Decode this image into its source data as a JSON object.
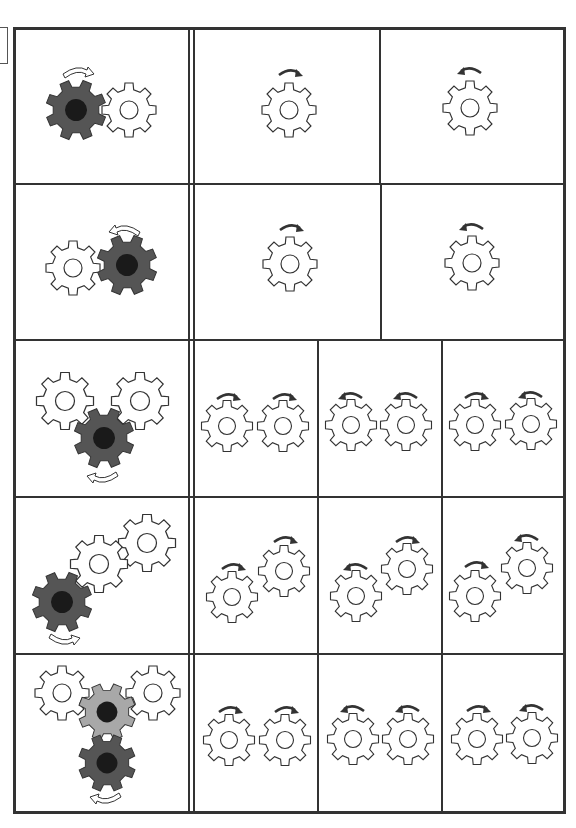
{
  "worksheet": {
    "type": "gear-rotation-direction-exercise",
    "colors": {
      "line": "#333333",
      "driver_gear": "#555555",
      "driver_hub": "#1a1a1a",
      "middle_gear": "#a8a8a8",
      "outline_gear": "#ffffff",
      "arrow": "#333333"
    },
    "rows": [
      {
        "name": "row-1",
        "example": {
          "gears": [
            {
              "role": "driver",
              "fill": "dark",
              "direction": "clockwise"
            },
            {
              "role": "driven",
              "fill": "white"
            }
          ],
          "layout": "horizontal-pair"
        },
        "options": [
          {
            "label": "option-a",
            "gears": [
              {
                "direction": "clockwise"
              }
            ]
          },
          {
            "label": "option-b",
            "gears": [
              {
                "direction": "counterclockwise"
              }
            ]
          }
        ]
      },
      {
        "name": "row-2",
        "example": {
          "gears": [
            {
              "role": "driven",
              "fill": "white"
            },
            {
              "role": "driver",
              "fill": "dark",
              "direction": "counterclockwise"
            }
          ],
          "layout": "horizontal-pair"
        },
        "options": [
          {
            "label": "option-a",
            "gears": [
              {
                "direction": "clockwise"
              }
            ]
          },
          {
            "label": "option-b",
            "gears": [
              {
                "direction": "counterclockwise"
              }
            ]
          }
        ]
      },
      {
        "name": "row-3",
        "example": {
          "gears": [
            {
              "role": "driven-left",
              "fill": "white"
            },
            {
              "role": "driven-right",
              "fill": "white"
            },
            {
              "role": "driver",
              "fill": "dark",
              "direction": "counterclockwise"
            }
          ],
          "layout": "triangle"
        },
        "options": [
          {
            "label": "option-a",
            "gears": [
              {
                "direction": "clockwise"
              },
              {
                "direction": "clockwise"
              }
            ]
          },
          {
            "label": "option-b",
            "gears": [
              {
                "direction": "counterclockwise"
              },
              {
                "direction": "counterclockwise"
              }
            ]
          },
          {
            "label": "option-c",
            "gears": [
              {
                "direction": "clockwise"
              },
              {
                "direction": "counterclockwise"
              }
            ]
          }
        ]
      },
      {
        "name": "row-4",
        "example": {
          "gears": [
            {
              "role": "driver",
              "fill": "dark",
              "direction": "clockwise"
            },
            {
              "role": "driven-middle",
              "fill": "white"
            },
            {
              "role": "driven-end",
              "fill": "white"
            }
          ],
          "layout": "diagonal-chain"
        },
        "options": [
          {
            "label": "option-a",
            "gears": [
              {
                "direction": "clockwise"
              },
              {
                "direction": "clockwise"
              }
            ]
          },
          {
            "label": "option-b",
            "gears": [
              {
                "direction": "counterclockwise"
              },
              {
                "direction": "clockwise"
              }
            ]
          },
          {
            "label": "option-c",
            "gears": [
              {
                "direction": "clockwise"
              },
              {
                "direction": "counterclockwise"
              }
            ]
          }
        ]
      },
      {
        "name": "row-5",
        "example": {
          "gears": [
            {
              "role": "driven-left",
              "fill": "white"
            },
            {
              "role": "middle",
              "fill": "gray"
            },
            {
              "role": "driven-right",
              "fill": "white"
            },
            {
              "role": "driver",
              "fill": "dark",
              "direction": "counterclockwise"
            }
          ],
          "layout": "t-shape"
        },
        "options": [
          {
            "label": "option-a",
            "gears": [
              {
                "direction": "clockwise"
              },
              {
                "direction": "clockwise"
              }
            ]
          },
          {
            "label": "option-b",
            "gears": [
              {
                "direction": "counterclockwise"
              },
              {
                "direction": "counterclockwise"
              }
            ]
          },
          {
            "label": "option-c",
            "gears": [
              {
                "direction": "clockwise"
              },
              {
                "direction": "counterclockwise"
              }
            ]
          }
        ]
      }
    ]
  }
}
